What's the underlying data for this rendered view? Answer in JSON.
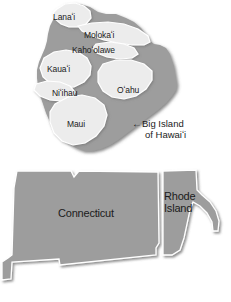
{
  "figure": {
    "type": "size-comparison-map",
    "background_color": "#ffffff"
  },
  "colors": {
    "big_island_fill": "#9d9d9d",
    "island_overlay_fill": "#ececec",
    "island_overlay_stroke": "#ffffff",
    "state_fill": "#9d9d9d",
    "state_stroke": "#ffffff",
    "shadow": "#6f6f6f",
    "text": "#1b1b1b"
  },
  "hawaii_panel": {
    "name": "Hawaiian Islands size comparison",
    "base_shape_label": "Big Island of Hawaiʻi",
    "islands": [
      {
        "id": "lanai",
        "label": "Lanaʻi"
      },
      {
        "id": "molokai",
        "label": "Molokaʻi"
      },
      {
        "id": "kahoolawe",
        "label": "Kahoʻolawe"
      },
      {
        "id": "kauai",
        "label": "Kauaʻi"
      },
      {
        "id": "niihau",
        "label": "Niʻihau"
      },
      {
        "id": "oahu",
        "label": "Oʻahu"
      },
      {
        "id": "maui",
        "label": "Maui"
      }
    ],
    "callout": {
      "arrow": "←",
      "line1": "Big Island",
      "line2": "of Hawaiʻi"
    }
  },
  "mainland_panel": {
    "name": "Connecticut and Rhode Island size comparison",
    "states": [
      {
        "id": "connecticut",
        "label": "Connecticut"
      },
      {
        "id": "rhode-island",
        "label_line1": "Rhode",
        "label_line2": "Island"
      }
    ]
  }
}
